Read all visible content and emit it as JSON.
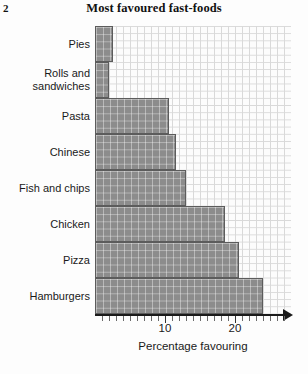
{
  "page_number": "2",
  "chart_data": {
    "type": "bar",
    "orientation": "horizontal",
    "title": "Most favoured fast-foods",
    "xlabel": "Percentage favouring",
    "ylabel": "",
    "xlim": [
      0,
      28
    ],
    "ylim": null,
    "grid": true,
    "legend": null,
    "tick_interval": 1,
    "tick_labels": [
      "10",
      "20"
    ],
    "tick_label_values": [
      10,
      20
    ],
    "categories": [
      "Pies",
      "Rolls and sandwiches",
      "Pasta",
      "Chinese",
      "Fish and chips",
      "Chicken",
      "Pizza",
      "Hamburgers"
    ],
    "category_lines": [
      [
        "Pies"
      ],
      [
        "Rolls and",
        "sandwiches"
      ],
      [
        "Pasta"
      ],
      [
        "Chinese"
      ],
      [
        "Fish and chips"
      ],
      [
        "Chicken"
      ],
      [
        "Pizza"
      ],
      [
        "Hamburgers"
      ]
    ],
    "values": [
      2.5,
      2,
      10.5,
      11.5,
      13,
      18.5,
      20.5,
      24
    ],
    "bar_color": "#8c8c8c",
    "bar_border_color": "#5c5c5c",
    "grid_color": "#d9d9d9",
    "axis_color": "#1a1a1a"
  }
}
